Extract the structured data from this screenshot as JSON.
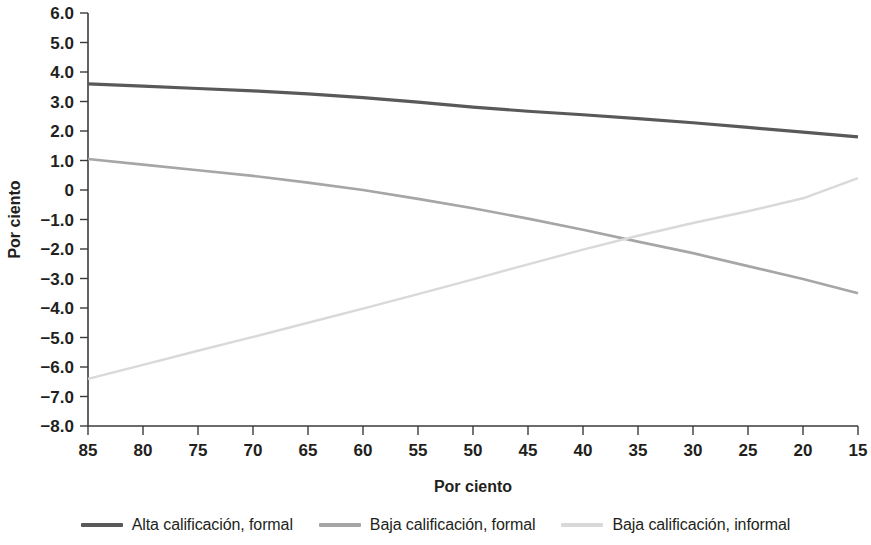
{
  "chart_data": {
    "type": "line",
    "title": "",
    "xlabel": "Por ciento",
    "ylabel": "Por ciento",
    "x_tick_labels": [
      "85",
      "80",
      "75",
      "70",
      "65",
      "60",
      "55",
      "50",
      "45",
      "40",
      "35",
      "30",
      "25",
      "20",
      "15"
    ],
    "x": [
      85,
      80,
      75,
      70,
      65,
      60,
      55,
      50,
      45,
      40,
      35,
      30,
      25,
      20,
      15
    ],
    "xlim": [
      85,
      15
    ],
    "x_axis_reversed": true,
    "y_tick_labels": [
      "6.0",
      "5.0",
      "4.0",
      "3.0",
      "2.0",
      "1.0",
      "0",
      "-1.0",
      "-2.0",
      "-3.0",
      "-4.0",
      "-5.0",
      "-6.0",
      "-7.0",
      "-8.0"
    ],
    "y_ticks": [
      6.0,
      5.0,
      4.0,
      3.0,
      2.0,
      1.0,
      0,
      -1.0,
      -2.0,
      -3.0,
      -4.0,
      -5.0,
      -6.0,
      -7.0,
      -8.0
    ],
    "ylim": [
      -8.0,
      6.0
    ],
    "grid": false,
    "legend_position": "bottom",
    "series": [
      {
        "name": "Alta calificación, formal",
        "color": "#595959",
        "width": 3.2,
        "values": [
          3.6,
          3.52,
          3.44,
          3.36,
          3.26,
          3.13,
          2.98,
          2.81,
          2.67,
          2.55,
          2.42,
          2.28,
          2.12,
          1.96,
          1.8
        ]
      },
      {
        "name": "Baja calificación, formal",
        "color": "#a6a6a6",
        "width": 2.6,
        "values": [
          1.05,
          0.86,
          0.67,
          0.48,
          0.25,
          0.0,
          -0.3,
          -0.62,
          -0.97,
          -1.35,
          -1.75,
          -2.14,
          -2.58,
          -3.02,
          -3.5
        ]
      },
      {
        "name": "Baja calificación, informal",
        "color": "#d9d9d9",
        "width": 2.4,
        "values": [
          -6.4,
          -5.93,
          -5.45,
          -4.98,
          -4.5,
          -4.02,
          -3.53,
          -3.03,
          -2.52,
          -2.02,
          -1.55,
          -1.12,
          -0.72,
          -0.28,
          0.4
        ]
      }
    ]
  },
  "legend": {
    "items": [
      {
        "label": "Alta calificación, formal",
        "color": "#595959"
      },
      {
        "label": "Baja calificación, formal",
        "color": "#a6a6a6"
      },
      {
        "label": "Baja calificación, informal",
        "color": "#d9d9d9"
      }
    ]
  }
}
